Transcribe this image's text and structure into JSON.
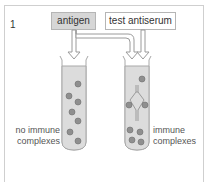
{
  "figure": {
    "panel_number": "1",
    "reagents": {
      "antigen_label": "antigen",
      "antiserum_label": "test antiserum"
    },
    "tubes": [
      {
        "id": "left",
        "result_label_line1": "no immune",
        "result_label_line2": "complexes"
      },
      {
        "id": "right",
        "result_label_line1": "immune",
        "result_label_line2": "complexes"
      }
    ],
    "colors": {
      "tube_fill": "#dcdcdc",
      "tube_border": "#a8a8a8",
      "particle_fill": "#8f8f8f",
      "antigen_box_fill": "#d6d6d6",
      "arrow_fill": "#ffffff",
      "arrow_stroke": "#9a9a9a"
    }
  }
}
